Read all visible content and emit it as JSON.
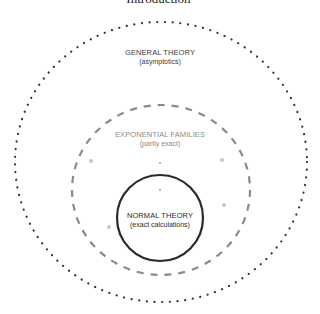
{
  "header": {
    "title": "Introduction"
  },
  "regions": [
    {
      "id": "general",
      "title": "GENERAL THEORY",
      "subtitle": "(asymptotics)",
      "border": "dotted",
      "color": "#333333"
    },
    {
      "id": "exponential",
      "title": "EXPONENTIAL FAMILIES",
      "subtitle": "(partly exact)",
      "border": "dashed",
      "color": "#8a8a8a"
    },
    {
      "id": "normal",
      "title": "NORMAL THEORY",
      "subtitle": "(exact calculations)",
      "border": "solid",
      "color": "#222222"
    }
  ]
}
